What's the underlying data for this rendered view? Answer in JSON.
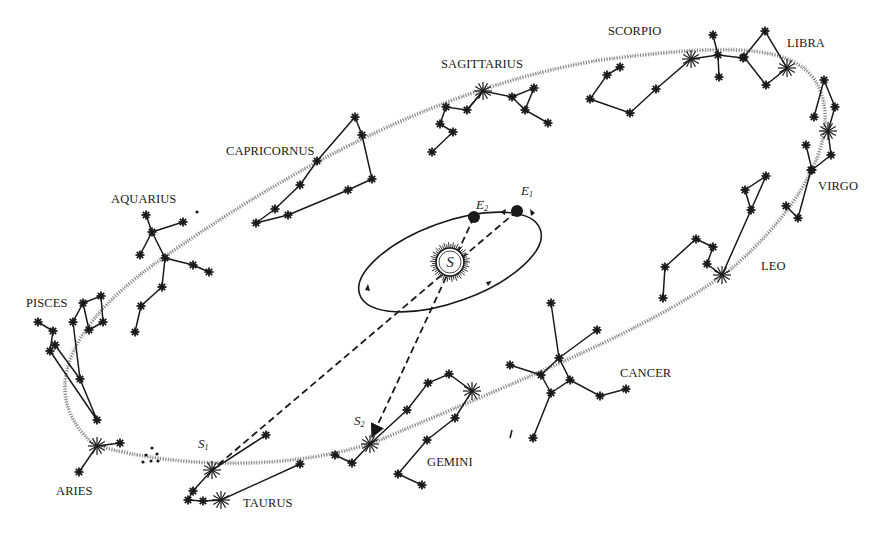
{
  "diagram": {
    "colors": {
      "ink": "#1a1a1a",
      "ecliptic": "#7a7a7a",
      "background": "#ffffff"
    },
    "sun": {
      "label": "S",
      "cx": 450,
      "cy": 262,
      "r": 14
    },
    "earth_orbit": {
      "cx": 450,
      "cy": 262,
      "rx": 96,
      "ry": 40,
      "rotation": -20
    },
    "earth_positions": [
      {
        "id": "E1",
        "label": "E",
        "subscript": "1",
        "x": 517,
        "y": 211,
        "label_x": 521,
        "label_y": 184
      },
      {
        "id": "E2",
        "label": "E",
        "subscript": "2",
        "x": 474,
        "y": 217,
        "label_x": 476,
        "label_y": 198
      }
    ],
    "sun_positions": [
      {
        "id": "S1",
        "label": "S",
        "subscript": "1",
        "x": 212,
        "y": 470,
        "label_x": 198,
        "label_y": 437
      },
      {
        "id": "S2",
        "label": "S",
        "subscript": "2",
        "x": 370,
        "y": 440,
        "label_x": 354,
        "label_y": 414
      }
    ],
    "constellations": [
      {
        "name": "SAGITTARIUS",
        "label_x": 441,
        "label_y": 58
      },
      {
        "name": "SCORPIO",
        "label_x": 608,
        "label_y": 25
      },
      {
        "name": "LIBRA",
        "label_x": 787,
        "label_y": 37
      },
      {
        "name": "VIRGO",
        "label_x": 818,
        "label_y": 180
      },
      {
        "name": "LEO",
        "label_x": 761,
        "label_y": 260
      },
      {
        "name": "CANCER",
        "label_x": 620,
        "label_y": 367
      },
      {
        "name": "GEMINI",
        "label_x": 427,
        "label_y": 456
      },
      {
        "name": "TAURUS",
        "label_x": 243,
        "label_y": 497
      },
      {
        "name": "ARIES",
        "label_x": 56,
        "label_y": 485
      },
      {
        "name": "PISCES",
        "label_x": 26,
        "label_y": 297
      },
      {
        "name": "AQUARIUS",
        "label_x": 111,
        "label_y": 193
      },
      {
        "name": "CAPRICORNUS",
        "label_x": 226,
        "label_y": 145
      }
    ]
  }
}
